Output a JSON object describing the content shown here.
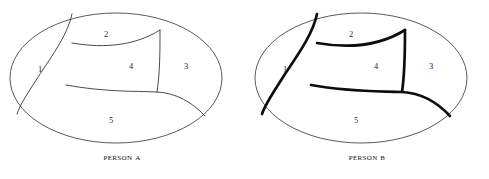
{
  "figure": {
    "background_color": "#ffffff",
    "ink_color": "#2b2b2b",
    "outline_color": "#3c3c3c",
    "panel_count": 2
  },
  "panels": [
    {
      "id": "person-a",
      "caption": "Person A",
      "line_style": "thin",
      "stroke_width": 0.85,
      "regions": [
        {
          "id": "a-region-1",
          "label": "1",
          "x": 40,
          "y": 70
        },
        {
          "id": "a-region-2",
          "label": "2",
          "x": 106,
          "y": 35
        },
        {
          "id": "a-region-3",
          "label": "3",
          "x": 186,
          "y": 67
        },
        {
          "id": "a-region-4",
          "label": "4",
          "x": 131,
          "y": 67
        },
        {
          "id": "a-region-5",
          "label": "5",
          "x": 111,
          "y": 121
        }
      ]
    },
    {
      "id": "person-b",
      "caption": "Person B",
      "line_style": "bold",
      "stroke_width": 2.7,
      "regions": [
        {
          "id": "b-region-1",
          "label": "1",
          "x": 40,
          "y": 70
        },
        {
          "id": "b-region-2",
          "label": "2",
          "x": 106,
          "y": 35
        },
        {
          "id": "b-region-3",
          "label": "3",
          "x": 186,
          "y": 67
        },
        {
          "id": "b-region-4",
          "label": "4",
          "x": 131,
          "y": 67
        },
        {
          "id": "b-region-5",
          "label": "5",
          "x": 111,
          "y": 121
        }
      ]
    }
  ],
  "geometry": {
    "ellipse": {
      "cx": 116,
      "cy": 78,
      "rx": 106,
      "ry": 65
    },
    "cuts": {
      "region1_boundary": "M 72,14 C 68,34 52,56 40,74 C 30,90 20,104 17,114",
      "region2_boundary": "M 72,43 C 106,49 136,45 160,30",
      "region4_right": "M 160,30 C 160,52 160,72 157,92",
      "region5_boundary": "M 66,85 C 104,92 134,91 157,92 C 176,93 192,102 205,116"
    }
  }
}
